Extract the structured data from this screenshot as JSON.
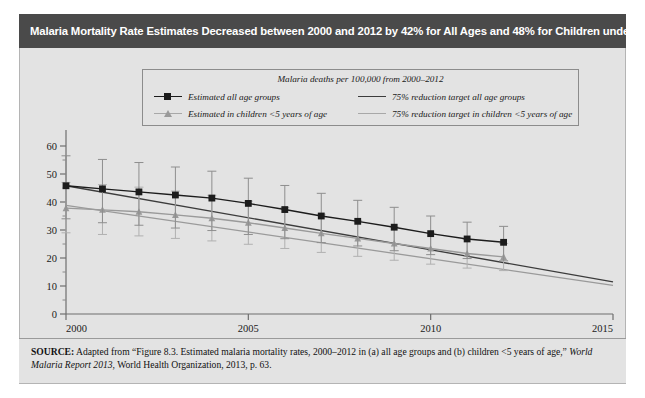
{
  "title": "Malaria Mortality Rate Estimates Decreased between 2000 and 2012 by 42% for All Ages and 48% for Children under 5",
  "legend": {
    "title": "Malaria deaths per 100,000 from 2000–2012",
    "entries": [
      {
        "label": "Estimated all age groups",
        "marker": "square-marker",
        "color": "#1c1c1c"
      },
      {
        "label": "75% reduction target all age groups",
        "marker": "line-swatch",
        "color": "#3c3c3c"
      },
      {
        "label": "Estimated in children <5 years of age",
        "marker": "triangle-marker",
        "color": "#9a9a9a"
      },
      {
        "label": "75% reduction target in children <5 years of age",
        "marker": "line-swatch",
        "color": "#9a9a9a"
      }
    ]
  },
  "source": {
    "label": "SOURCE:",
    "line1_a": " Adapted from “Figure 8.3. Estimated malaria mortality rates, 2000–2012 in (a) all age groups and (b) children <5 years of age,” ",
    "italic_title": "World Malaria Report 2013",
    "line1_b": ", World Health Organization, 2013, p. 63."
  },
  "chart_data": {
    "type": "line",
    "title": "Malaria deaths per 100,000 from 2000–2012",
    "xlabel": "",
    "ylabel": "",
    "xlim": [
      2000,
      2015
    ],
    "ylim": [
      0,
      60
    ],
    "xticks": [
      2000,
      2005,
      2010,
      2015
    ],
    "yticks": [
      0,
      10,
      20,
      30,
      40,
      50,
      60
    ],
    "yminorticks": [
      5,
      15,
      25,
      35,
      45,
      55
    ],
    "grid": false,
    "legend_position": "top-center",
    "x": [
      2000,
      2001,
      2002,
      2003,
      2004,
      2005,
      2006,
      2007,
      2008,
      2009,
      2010,
      2011,
      2012
    ],
    "series": [
      {
        "name": "Estimated all age groups",
        "marker": "square",
        "color": "#1c1c1c",
        "values": [
          45.8,
          44.7,
          43.6,
          42.5,
          41.4,
          39.5,
          37.3,
          35.0,
          33.1,
          31.0,
          28.7,
          26.8,
          25.6
        ],
        "error_low": [
          34.0,
          32.6,
          31.7,
          30.7,
          29.8,
          28.4,
          26.9,
          25.5,
          24.3,
          22.6,
          21.2,
          19.8,
          19.0
        ],
        "error_high": [
          56.5,
          55.2,
          54.1,
          52.5,
          51.0,
          48.5,
          45.9,
          43.1,
          40.6,
          38.1,
          35.0,
          32.8,
          31.3
        ]
      },
      {
        "name": "Estimated in children <5 years of age",
        "marker": "triangle",
        "color": "#9a9a9a",
        "values": [
          37.8,
          37.2,
          36.5,
          35.4,
          34.2,
          32.6,
          30.7,
          28.8,
          27.0,
          25.2,
          23.4,
          21.6,
          20.4
        ],
        "error_low": [
          29.0,
          28.4,
          27.9,
          27.0,
          26.1,
          24.9,
          23.4,
          22.0,
          20.6,
          19.2,
          17.8,
          16.4,
          15.5
        ],
        "error_high": [
          47.0,
          46.2,
          45.3,
          43.9,
          42.4,
          40.3,
          38.0,
          35.6,
          33.3,
          31.1,
          28.9,
          26.6,
          25.2
        ]
      },
      {
        "name": "75% reduction target all age groups",
        "marker": "none",
        "color": "#3c3c3c",
        "line_only": true,
        "x_endpoints": [
          2000,
          2015
        ],
        "y_endpoints": [
          45.8,
          11.5
        ]
      },
      {
        "name": "75% reduction target in children <5 years of age",
        "marker": "none",
        "color": "#9a9a9a",
        "line_only": true,
        "x_endpoints": [
          2000,
          2015
        ],
        "y_endpoints": [
          38.8,
          10.2
        ]
      }
    ]
  },
  "axes": {
    "y_tick_labels": [
      "0",
      "10",
      "20",
      "30",
      "40",
      "50",
      "60"
    ],
    "x_tick_labels": [
      "2000",
      "2005",
      "2010",
      "2015"
    ]
  }
}
